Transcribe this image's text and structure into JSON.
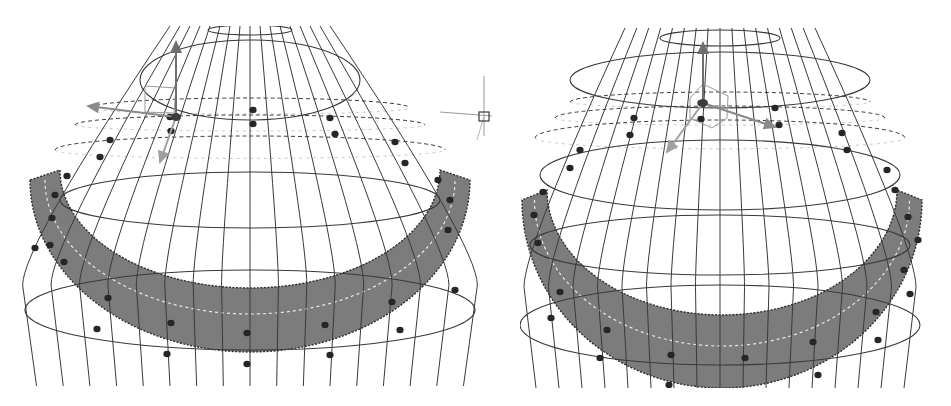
{
  "figure": {
    "background": "#ffffff",
    "line_color": "#3a3a3a",
    "band_fill": "#7c7c7c",
    "band_edge": "#2e2e2e",
    "band_dash_color": "#e8e8e8",
    "point_color": "#262626",
    "gizmo_colors": {
      "y_axis": "#6e6e6e",
      "x_axis": "#8a8a8a",
      "z_axis": "#a0a0a0",
      "plane_handle": "#8c8c8c"
    }
  },
  "panels": [
    {
      "id": "left",
      "label": "",
      "view": "perspective-front",
      "clip": {
        "x": 20,
        "y": 26,
        "w": 462,
        "h": 360
      },
      "surface": {
        "cx": 250,
        "top_y": 26,
        "bottom_y": 386,
        "neck_half_width": 80,
        "body_half_width": 232,
        "meridians": 16,
        "rings": [
          {
            "cy": 30,
            "rx": 42,
            "ry": 5
          },
          {
            "cy": 80,
            "rx": 110,
            "ry": 40
          },
          {
            "cy": 200,
            "rx": 190,
            "ry": 28
          },
          {
            "cy": 310,
            "rx": 225,
            "ry": 40
          }
        ]
      },
      "band": {
        "cx": 250,
        "outer_top": 180,
        "outer_rx": 220,
        "outer_ry": 172,
        "inner_cy": 190,
        "inner_rx": 190,
        "inner_ry": 118,
        "thickness": 44
      },
      "dashed_rings": [
        {
          "cy": 108,
          "rx": 160,
          "ry": 10
        },
        {
          "cy": 125,
          "rx": 175,
          "ry": 10
        },
        {
          "cy": 150,
          "rx": 195,
          "ry": 14
        }
      ],
      "control_points": [
        [
          253,
          110
        ],
        [
          253,
          124
        ],
        [
          330,
          118
        ],
        [
          335,
          134
        ],
        [
          170,
          117
        ],
        [
          171,
          131
        ],
        [
          110,
          140
        ],
        [
          100,
          157
        ],
        [
          67,
          176
        ],
        [
          55,
          195
        ],
        [
          395,
          142
        ],
        [
          405,
          163
        ],
        [
          438,
          180
        ],
        [
          450,
          200
        ],
        [
          52,
          218
        ],
        [
          50,
          245
        ],
        [
          64,
          262
        ],
        [
          108,
          298
        ],
        [
          97,
          329
        ],
        [
          171,
          323
        ],
        [
          247,
          333
        ],
        [
          325,
          325
        ],
        [
          392,
          302
        ],
        [
          400,
          330
        ],
        [
          167,
          354
        ],
        [
          247,
          364
        ],
        [
          330,
          355
        ],
        [
          448,
          230
        ],
        [
          455,
          290
        ],
        [
          35,
          248
        ]
      ],
      "gizmo": {
        "origin": [
          176,
          117
        ],
        "y_tip": [
          176,
          42
        ],
        "x_tip": [
          88,
          106
        ],
        "z_tip": [
          160,
          162
        ],
        "plane": [
          [
            145,
            86
          ],
          [
            176,
            88
          ],
          [
            174,
            113
          ],
          [
            145,
            112
          ]
        ]
      },
      "cursor": {
        "x": 484,
        "y": 116,
        "size": 8
      }
    },
    {
      "id": "right",
      "label": "",
      "view": "perspective-front-rotated",
      "clip": {
        "x": 520,
        "y": 28,
        "w": 405,
        "h": 360
      },
      "surface": {
        "cx": 720,
        "top_y": 28,
        "bottom_y": 388,
        "neck_half_width": 95,
        "body_half_width": 200,
        "meridians": 16,
        "rings": [
          {
            "cy": 38,
            "rx": 60,
            "ry": 8
          },
          {
            "cy": 80,
            "rx": 150,
            "ry": 28
          },
          {
            "cy": 175,
            "rx": 180,
            "ry": 35
          },
          {
            "cy": 245,
            "rx": 190,
            "ry": 30
          },
          {
            "cy": 325,
            "rx": 200,
            "ry": 40
          }
        ]
      },
      "band": {
        "cx": 722,
        "outer_top": 200,
        "outer_rx": 200,
        "outer_ry": 188,
        "inner_cy": 210,
        "inner_rx": 175,
        "inner_ry": 125,
        "thickness": 42
      },
      "dashed_rings": [
        {
          "cy": 102,
          "rx": 150,
          "ry": 10
        },
        {
          "cy": 118,
          "rx": 165,
          "ry": 12
        },
        {
          "cy": 138,
          "rx": 185,
          "ry": 18
        }
      ],
      "control_points": [
        [
          701,
          103
        ],
        [
          701,
          119
        ],
        [
          775,
          108
        ],
        [
          779,
          125
        ],
        [
          634,
          118
        ],
        [
          630,
          135
        ],
        [
          580,
          150
        ],
        [
          570,
          168
        ],
        [
          543,
          192
        ],
        [
          534,
          215
        ],
        [
          842,
          133
        ],
        [
          847,
          150
        ],
        [
          887,
          170
        ],
        [
          895,
          190
        ],
        [
          908,
          217
        ],
        [
          918,
          240
        ],
        [
          538,
          243
        ],
        [
          560,
          292
        ],
        [
          551,
          318
        ],
        [
          607,
          330
        ],
        [
          671,
          355
        ],
        [
          745,
          358
        ],
        [
          813,
          342
        ],
        [
          876,
          312
        ],
        [
          878,
          340
        ],
        [
          600,
          358
        ],
        [
          669,
          385
        ],
        [
          818,
          375
        ],
        [
          904,
          270
        ],
        [
          910,
          294
        ]
      ],
      "gizmo": {
        "origin": [
          703,
          103
        ],
        "y_tip": [
          703,
          43
        ],
        "x_tip": [
          775,
          127
        ],
        "z_tip": [
          667,
          152
        ],
        "plane": [
          [
            703,
            84
          ],
          [
            728,
            96
          ],
          [
            727,
            118
          ],
          [
            712,
            128
          ],
          [
            690,
            118
          ],
          [
            690,
            98
          ]
        ]
      },
      "cursor": null
    }
  ]
}
